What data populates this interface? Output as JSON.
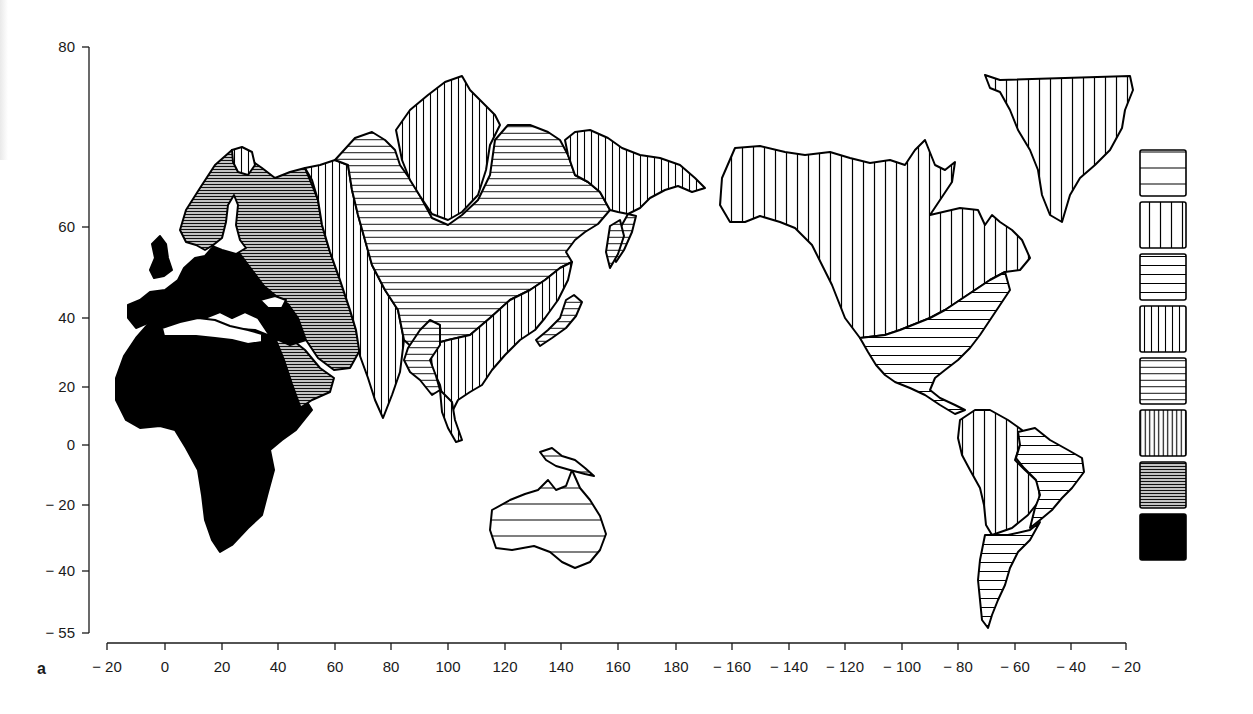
{
  "figure": {
    "panel_label": "a",
    "type": "choropleth world map with hatch-pattern legend",
    "projection_note": "Pacific-centred; longitude -20 to 340 (wrapping to -20)"
  },
  "axes": {
    "y": {
      "ticks": [
        {
          "value": 80,
          "label": "80",
          "px": 47
        },
        {
          "value": 60,
          "label": "60",
          "px": 227
        },
        {
          "value": 40,
          "label": "40",
          "px": 318
        },
        {
          "value": 20,
          "label": "20",
          "px": 387
        },
        {
          "value": 0,
          "label": "0",
          "px": 445
        },
        {
          "value": -20,
          "label": "− 20",
          "px": 505
        },
        {
          "value": -40,
          "label": "− 40",
          "px": 571
        },
        {
          "value": -55,
          "label": "− 55",
          "px": 633
        }
      ]
    },
    "x": {
      "ticks": [
        {
          "value": -20,
          "label": "− 20",
          "px": 107
        },
        {
          "value": 0,
          "label": "0",
          "px": 165
        },
        {
          "value": 20,
          "label": "20",
          "px": 222
        },
        {
          "value": 40,
          "label": "40",
          "px": 278
        },
        {
          "value": 60,
          "label": "60",
          "px": 335
        },
        {
          "value": 80,
          "label": "80",
          "px": 391
        },
        {
          "value": 100,
          "label": "100",
          "px": 448
        },
        {
          "value": 120,
          "label": "120",
          "px": 505
        },
        {
          "value": 140,
          "label": "140",
          "px": 561
        },
        {
          "value": 160,
          "label": "160",
          "px": 618
        },
        {
          "value": 180,
          "label": "180",
          "px": 676
        },
        {
          "value": -160,
          "label": "− 160",
          "px": 732
        },
        {
          "value": -140,
          "label": "− 140",
          "px": 789
        },
        {
          "value": -120,
          "label": "− 120",
          "px": 845
        },
        {
          "value": -100,
          "label": "− 100",
          "px": 902
        },
        {
          "value": -80,
          "label": "− 80",
          "px": 958
        },
        {
          "value": -60,
          "label": "− 60",
          "px": 1015
        },
        {
          "value": -40,
          "label": "− 40",
          "px": 1071
        },
        {
          "value": -20,
          "label": "− 20",
          "px": 1126
        }
      ]
    }
  },
  "legend": {
    "position": "right",
    "note": "8 classes, ordered top (lowest) to bottom (highest); no text labels shown",
    "items": [
      {
        "class": 1,
        "pattern": "horizontal",
        "lines": 2,
        "pattern_id": "h2"
      },
      {
        "class": 2,
        "pattern": "vertical",
        "lines": 3,
        "pattern_id": "v3"
      },
      {
        "class": 3,
        "pattern": "horizontal",
        "lines": 4,
        "pattern_id": "h4"
      },
      {
        "class": 4,
        "pattern": "vertical",
        "lines": 5,
        "pattern_id": "v5"
      },
      {
        "class": 5,
        "pattern": "horizontal",
        "lines": 6,
        "pattern_id": "h6"
      },
      {
        "class": 6,
        "pattern": "vertical",
        "lines": 9,
        "pattern_id": "v9"
      },
      {
        "class": 7,
        "pattern": "horizontal",
        "lines": 16,
        "pattern_id": "h16"
      },
      {
        "class": 8,
        "pattern": "solid",
        "lines": 0,
        "pattern_id": "solid"
      }
    ]
  },
  "chart_data": {
    "type": "heatmap",
    "title": "",
    "panel": "a",
    "xlabel": "Longitude",
    "ylabel": "Latitude",
    "xlim": [
      -20,
      340
    ],
    "ylim": [
      -55,
      80
    ],
    "x_tick_labels": [
      "-20",
      "0",
      "20",
      "40",
      "60",
      "80",
      "100",
      "120",
      "140",
      "160",
      "180",
      "-160",
      "-140",
      "-120",
      "-100",
      "-80",
      "-60",
      "-40",
      "-20"
    ],
    "y_tick_labels": [
      "80",
      "60",
      "40",
      "20",
      "0",
      "-20",
      "-40",
      "-55"
    ],
    "legend_classes": 8,
    "regions": [
      {
        "name": "Africa",
        "class": 8
      },
      {
        "name": "Western & Central Europe",
        "class": 8
      },
      {
        "name": "Middle East / Arabia",
        "class": 8
      },
      {
        "name": "Scandinavia & European Russia",
        "class": 7
      },
      {
        "name": "Arabian Peninsula (east) / Caucasus",
        "class": 7
      },
      {
        "name": "Kola Peninsula",
        "class": 4
      },
      {
        "name": "Western Siberia / Central Asia / Indian subcontinent",
        "class": 4
      },
      {
        "name": "Central Siberia & Mongolia",
        "class": 3
      },
      {
        "name": "Taymyr / Northern Central Siberia",
        "class": 4
      },
      {
        "name": "Eastern Siberia (Chukotka)",
        "class": 4
      },
      {
        "name": "China & Southeast Asia",
        "class": 4
      },
      {
        "name": "Tibet / Indochina interior",
        "class": 3
      },
      {
        "name": "Kamchatka / Sakhalin / Japan",
        "class": 3
      },
      {
        "name": "Australia",
        "class": 1
      },
      {
        "name": "New Guinea",
        "class": 1
      },
      {
        "name": "Alaska & Canada",
        "class": 2
      },
      {
        "name": "Greenland",
        "class": 2
      },
      {
        "name": "Eastern & Southern USA / Mexico / Central America",
        "class": 3
      },
      {
        "name": "Northern & Western South America",
        "class": 2
      },
      {
        "name": "Eastern Brazil",
        "class": 3
      },
      {
        "name": "Southern South America",
        "class": 3
      }
    ]
  },
  "map": {
    "shapes": [
      {
        "name": "africa",
        "fill": "solid",
        "d": "M150,322 L170,312 L200,316 L225,328 L255,330 L270,336 L285,352 L298,380 L307,402 L312,410 L296,430 L282,440 L270,450 L274,470 L268,492 L262,515 L248,528 L232,545 L220,552 L212,540 L205,520 L202,495 L198,470 L186,448 L175,430 L160,426 L140,428 L126,420 L116,400 L116,378 L124,356 L136,338 Z"
      },
      {
        "name": "arabia",
        "fill": "h16",
        "d": "M265,336 L290,338 L305,350 L320,368 L334,378 L330,392 L312,400 L300,408 L290,398 L280,376 L272,358 Z"
      },
      {
        "name": "arabia-west",
        "fill": "solid",
        "d": "M262,336 L275,338 L284,360 L292,384 L300,406 L296,412 L288,396 L276,372 L266,352 Z"
      },
      {
        "name": "europe-west",
        "fill": "solid",
        "d": "M128,305 L140,300 L150,292 L165,290 L178,280 L184,268 L195,258 L205,256 L212,248 L222,240 L236,244 L248,260 L258,278 L268,290 L278,300 L290,306 L300,320 L306,340 L290,345 L270,336 L258,318 L245,312 L232,318 L220,312 L205,318 L185,322 L170,312 L150,322 L136,328 L128,318 Z"
      },
      {
        "name": "britain",
        "fill": "solid",
        "d": "M150,270 L155,258 L152,244 L160,236 L166,244 L168,258 L172,270 L164,276 L154,278 Z"
      },
      {
        "name": "scandinavia-russia",
        "fill": "h16",
        "d": "M180,230 L186,210 L200,188 L215,165 L232,150 L245,156 L262,168 L275,178 L290,172 L305,168 L310,180 L318,200 L322,225 L330,252 L340,280 L350,310 L356,330 L360,350 L350,368 L334,370 L318,358 L306,340 L298,318 L288,304 L276,296 L264,286 L252,270 L240,254 L228,238 L215,244 L205,250 L196,245 L186,242 Z"
      },
      {
        "name": "kola",
        "fill": "v5",
        "d": "M232,150 L242,147 L252,152 L255,165 L248,175 L238,172 L233,162 Z"
      },
      {
        "name": "baltic-sea",
        "fill": "white",
        "d": "M228,205 L234,195 L238,205 L236,225 L240,240 L246,248 L236,254 L222,250 L212,246 L222,238 L226,222 Z"
      },
      {
        "name": "mediterranean",
        "fill": "white",
        "d": "M162,328 L180,322 L198,318 L215,320 L230,326 L248,330 L262,334 L262,342 L248,344 L232,340 L215,338 L196,336 L178,336 L164,336 Z"
      },
      {
        "name": "black-sea",
        "fill": "white",
        "d": "M260,300 L275,296 L286,300 L282,308 L268,308 Z"
      },
      {
        "name": "west-siberia-india",
        "fill": "v5",
        "d": "M305,168 L320,165 L335,160 L348,165 L352,190 L358,215 L365,240 L372,265 L385,290 L398,310 L404,340 L400,372 L392,395 L383,418 L375,400 L368,378 L360,356 L356,330 L350,310 L340,280 L330,252 L322,225 L318,200 L312,180 Z"
      },
      {
        "name": "central-siberia",
        "fill": "h6",
        "d": "M335,160 L355,138 L372,132 L385,140 L395,150 L400,165 L412,182 L420,196 L432,218 L448,225 L462,215 L478,200 L490,175 L495,140 L508,125 L530,125 L548,132 L560,140 L568,155 L575,175 L588,182 L600,192 L610,210 L598,224 L585,232 L575,240 L566,252 L572,262 L560,268 L545,280 L530,290 L510,300 L490,318 L470,335 L448,340 L430,345 L415,350 L404,340 L398,310 L385,290 L372,265 L365,240 L358,215 L352,190 L348,165 Z"
      },
      {
        "name": "taymyr",
        "fill": "v5",
        "d": "M396,130 L410,110 L428,95 L445,82 L462,76 L470,90 L480,100 L495,115 L500,125 L490,145 L486,170 L478,195 L462,212 L448,220 L432,214 L420,196 L410,180 L402,160 Z"
      },
      {
        "name": "chukotka",
        "fill": "v5",
        "d": "M565,140 L575,132 L590,130 L608,138 L622,148 L640,155 L660,158 L680,165 L695,178 L705,188 L692,192 L678,186 L665,190 L650,198 L640,208 L628,214 L618,212 L610,210 L600,192 L588,182 L575,175 L568,155 Z"
      },
      {
        "name": "kamchatka",
        "fill": "h6",
        "d": "M628,214 L636,216 L632,232 L624,250 L616,262 L612,250 L618,232 Z"
      },
      {
        "name": "china-sea",
        "fill": "v5",
        "d": "M430,345 L448,340 L470,335 L490,318 L510,300 L530,290 L545,280 L560,268 L572,262 L568,280 L558,300 L545,318 L535,330 L520,340 L505,355 L492,370 L482,385 L470,392 L458,400 L450,416 L444,405 L440,385 L432,368 Z"
      },
      {
        "name": "tibet-indochina",
        "fill": "h6",
        "d": "M408,348 L420,330 L430,320 L440,325 L440,345 L430,360 L436,376 L440,390 L432,395 L420,380 L410,372 L404,360 Z"
      },
      {
        "name": "indochina-lower",
        "fill": "v5",
        "d": "M440,390 L452,402 L455,420 L462,440 L456,442 L448,428 L442,412 Z"
      },
      {
        "name": "japan",
        "fill": "h6",
        "d": "M566,300 L574,295 L582,302 L576,316 L566,328 L552,338 L540,346 L536,340 L548,330 L560,318 Z"
      },
      {
        "name": "sakhalin",
        "fill": "h6",
        "d": "M610,226 L620,220 L624,236 L618,254 L610,268 L606,252 Z"
      },
      {
        "name": "australia",
        "fill": "h2",
        "d": "M492,510 L510,500 L525,494 L538,490 L548,480 L556,490 L566,486 L572,470 L580,488 L590,500 L600,516 L606,534 L600,550 L590,562 L575,568 L562,562 L550,552 L534,546 L512,550 L496,548 L490,530 Z"
      },
      {
        "name": "new-guinea",
        "fill": "h2",
        "d": "M540,452 L552,448 L562,456 L575,460 L585,468 L594,476 L585,474 L570,470 L556,466 L546,460 Z"
      },
      {
        "name": "alaska-canada",
        "fill": "v3",
        "d": "M722,178 L735,148 L760,146 L785,152 L805,155 L830,152 L850,158 L870,163 L890,160 L905,165 L915,150 L925,140 L935,165 L945,170 L955,162 L952,182 L940,200 L930,215 L960,208 L978,210 L985,225 L992,215 L1000,222 L1012,230 L1022,240 L1030,258 L1020,270 L1005,272 L990,280 L975,290 L960,300 L945,310 L930,318 L915,324 L900,330 L885,335 L860,338 L845,318 L832,285 L812,245 L795,228 L780,222 L760,216 L745,222 L730,222 L720,205 Z"
      },
      {
        "name": "greenland",
        "fill": "v3",
        "d": "M985,75 L1000,80 L1130,76 L1133,90 L1125,110 L1122,128 L1110,150 L1095,165 L1080,178 L1070,195 L1062,222 L1050,215 L1042,195 L1038,170 L1030,150 L1018,130 L1010,110 L1000,92 L990,88 Z"
      },
      {
        "name": "usa-mexico",
        "fill": "h4",
        "d": "M860,338 L885,335 L900,330 L915,324 L930,318 L945,310 L960,300 L975,290 L990,280 L1005,272 L1010,290 L1000,305 L990,320 L980,335 L970,348 L958,360 L945,370 L935,378 L930,390 L940,398 L955,405 L965,410 L955,414 L940,405 L925,395 L910,388 L895,382 L885,375 L876,365 L868,352 Z"
      },
      {
        "name": "south-america-north",
        "fill": "v3",
        "d": "M960,420 L975,410 L990,410 L1008,420 L1022,430 L1020,445 L1015,460 L1025,470 L1038,482 L1040,500 L1028,515 L1012,528 L992,535 L986,525 L984,505 L980,488 L970,470 L962,455 L958,438 Z"
      },
      {
        "name": "east-brazil",
        "fill": "h4",
        "d": "M1018,432 L1035,428 L1050,440 L1068,450 L1082,458 L1084,472 L1072,488 L1062,498 L1052,510 L1040,520 L1030,528 L1035,508 L1040,495 L1036,480 L1024,468 L1016,458 L1020,445 Z"
      },
      {
        "name": "south-america-south",
        "fill": "h4",
        "d": "M985,535 L1008,535 L1030,530 L1040,522 L1030,540 L1018,552 L1010,568 L1005,585 L998,600 L992,615 L988,628 L982,620 L980,600 L978,580 L980,560 Z"
      }
    ]
  }
}
